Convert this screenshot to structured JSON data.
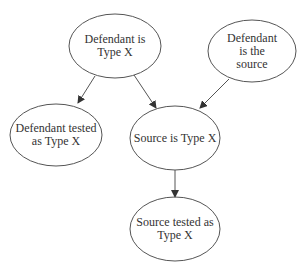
{
  "diagram": {
    "type": "directed-graph",
    "colors": {
      "stroke": "#555555",
      "text": "#333333",
      "background": "#ffffff"
    },
    "nodes": [
      {
        "id": "defendant_type_x",
        "label": "Defendant is\nType X",
        "cx": 115,
        "cy": 46,
        "rx": 46,
        "ry": 32
      },
      {
        "id": "defendant_is_source",
        "label": "Defendant is the\nsource",
        "cx": 252,
        "cy": 51,
        "rx": 44,
        "ry": 31
      },
      {
        "id": "defendant_tested",
        "label": "Defendant tested\nas Type X",
        "cx": 56,
        "cy": 135,
        "rx": 46,
        "ry": 31
      },
      {
        "id": "source_type_x",
        "label": "Source is Type X",
        "cx": 175,
        "cy": 138,
        "rx": 45,
        "ry": 32
      },
      {
        "id": "source_tested",
        "label": "Source tested as\nType X",
        "cx": 175,
        "cy": 229,
        "rx": 45,
        "ry": 32
      }
    ],
    "edges": [
      {
        "from": "defendant_type_x",
        "to": "defendant_tested",
        "x1": 95,
        "y1": 76,
        "x2": 78,
        "y2": 103
      },
      {
        "from": "defendant_type_x",
        "to": "source_type_x",
        "x1": 134,
        "y1": 75,
        "x2": 156,
        "y2": 108
      },
      {
        "from": "defendant_is_source",
        "to": "source_type_x",
        "x1": 229,
        "y1": 79,
        "x2": 200,
        "y2": 108
      },
      {
        "from": "source_type_x",
        "to": "source_tested",
        "x1": 175,
        "y1": 170,
        "x2": 175,
        "y2": 197
      }
    ]
  }
}
